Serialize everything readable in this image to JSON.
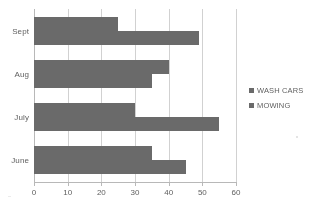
{
  "chart_data": {
    "type": "bar",
    "orientation": "horizontal",
    "title": "",
    "xlabel": "",
    "ylabel": "",
    "categories": [
      "Sept",
      "Aug",
      "July",
      "June"
    ],
    "series": [
      {
        "name": "WASH CARS",
        "color": "#666666",
        "values": [
          25,
          40,
          30,
          35
        ]
      },
      {
        "name": "MOWING",
        "color": "#666666",
        "values": [
          49,
          35,
          55,
          45
        ]
      }
    ],
    "xlim": [
      0,
      60
    ],
    "xticks": [
      0,
      10,
      20,
      30,
      40,
      50,
      60
    ],
    "xtick_labels": [
      "0",
      "10",
      "20",
      "30",
      "40",
      "50",
      "60"
    ],
    "grid": true,
    "grid_axis": "x",
    "legend": {
      "position": "right",
      "entries": [
        {
          "label": "WASH CARS",
          "marker": "square-swatch",
          "color": "#666666"
        },
        {
          "label": "MOWING",
          "marker": "square-swatch",
          "color": "#666666"
        }
      ]
    }
  },
  "colors": {
    "bar": "#666666",
    "gridline": "#d4d4d4",
    "axis": "#b9b9b9",
    "text": "#5a5a5a",
    "background": "#ffffff"
  }
}
